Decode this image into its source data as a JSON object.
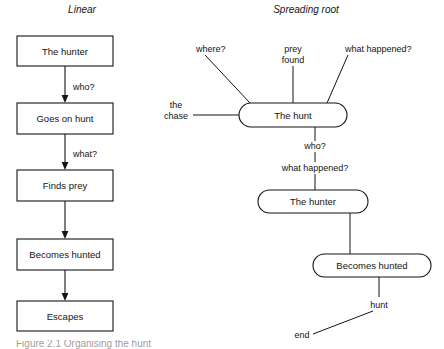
{
  "figure": {
    "panels": [
      {
        "id": "linear",
        "title": "Linear",
        "type": "flowchart-vertical",
        "nodes": [
          {
            "id": "n1",
            "label": "The hunter",
            "shape": "rect",
            "x": 17,
            "y": 36,
            "w": 96,
            "h": 30
          },
          {
            "id": "n2",
            "label": "Goes on hunt",
            "shape": "rect",
            "x": 17,
            "y": 103,
            "w": 96,
            "h": 31
          },
          {
            "id": "n3",
            "label": "Finds prey",
            "shape": "rect",
            "x": 17,
            "y": 170,
            "w": 96,
            "h": 31
          },
          {
            "id": "n4",
            "label": "Becomes hunted",
            "shape": "rect",
            "x": 17,
            "y": 239,
            "w": 96,
            "h": 31
          },
          {
            "id": "n5",
            "label": "Escapes",
            "shape": "rect",
            "x": 17,
            "y": 301,
            "w": 96,
            "h": 30
          }
        ],
        "edges": [
          {
            "from": "n1",
            "to": "n2",
            "label": "who?",
            "label_x": 73,
            "label_y": 87
          },
          {
            "from": "n2",
            "to": "n3",
            "label": "what?",
            "label_x": 73,
            "label_y": 154
          },
          {
            "from": "n3",
            "to": "n4",
            "label": "",
            "label_x": 0,
            "label_y": 0
          },
          {
            "from": "n4",
            "to": "n5",
            "label": "",
            "label_x": 0,
            "label_y": 0
          }
        ]
      },
      {
        "id": "spreading-root",
        "title": "Spreading root",
        "type": "radial-network",
        "nodes": [
          {
            "id": "h1",
            "label": "The hunt",
            "shape": "pill",
            "x": 239,
            "y": 103,
            "w": 108,
            "h": 24
          },
          {
            "id": "h2",
            "label": "The hunter",
            "shape": "pill",
            "x": 258,
            "y": 190,
            "w": 110,
            "h": 23
          },
          {
            "id": "h3",
            "label": "Becomes hunted",
            "shape": "pill",
            "x": 313,
            "y": 254,
            "w": 118,
            "h": 23
          }
        ],
        "branch_labels": [
          {
            "id": "b1",
            "text": "where?",
            "x": 196,
            "y": 50,
            "anchor": "start"
          },
          {
            "id": "b2",
            "text": "prey",
            "x": 293,
            "y": 50,
            "anchor": "middle"
          },
          {
            "id": "b3",
            "text": "found",
            "x": 293,
            "y": 60,
            "anchor": "middle"
          },
          {
            "id": "b4",
            "text": "what happened?",
            "x": 345,
            "y": 50,
            "anchor": "start"
          },
          {
            "id": "b5",
            "text": "the",
            "x": 176,
            "y": 107,
            "anchor": "middle"
          },
          {
            "id": "b6",
            "text": "chase",
            "x": 176,
            "y": 118,
            "anchor": "middle"
          },
          {
            "id": "b7",
            "text": "who?",
            "x": 315,
            "y": 148,
            "anchor": "middle"
          },
          {
            "id": "b8",
            "text": "what happened?",
            "x": 315,
            "y": 170,
            "anchor": "middle"
          },
          {
            "id": "b9",
            "text": "hunt",
            "x": 379,
            "y": 305,
            "anchor": "middle"
          },
          {
            "id": "b10",
            "text": "end",
            "x": 302,
            "y": 336,
            "anchor": "middle"
          }
        ]
      }
    ]
  },
  "colors": {
    "ink": "#141414",
    "paper": "#ffffff"
  },
  "caption": {
    "text": "Figure 2.1   Organising the hunt"
  }
}
